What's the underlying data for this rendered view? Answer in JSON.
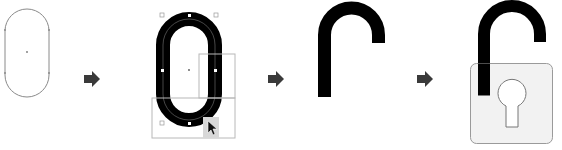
{
  "diagram": {
    "steps": [
      {
        "id": 1,
        "label": "Rounded rectangle outline"
      },
      {
        "id": 2,
        "label": "Thick stroke with selection rectangles"
      },
      {
        "id": 3,
        "label": "Shackle arch"
      },
      {
        "id": 4,
        "label": "Padlock with body and keyhole"
      }
    ],
    "arrows": 3,
    "colors": {
      "outline": "#8a8a8a",
      "stroke": "#000000",
      "arrow": "#3a3a3a",
      "selection": "#b8b8b8",
      "lock_body_fill": "#f1f1f1",
      "lock_body_stroke": "#9a9a9a",
      "cursor_box": "#d8d8d8"
    }
  }
}
